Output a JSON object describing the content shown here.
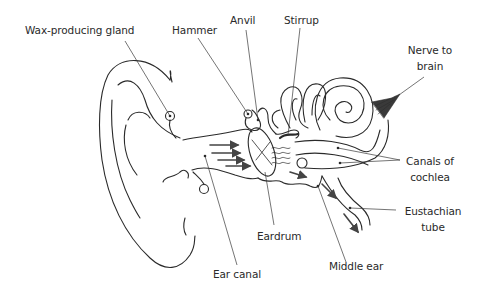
{
  "diagram": {
    "line_color": "#2a2a2a",
    "background": "#ffffff",
    "labels": {
      "wax_gland": "Wax-producing gland",
      "hammer": "Hammer",
      "anvil": "Anvil",
      "stirrup": "Stirrup",
      "nerve_line1": "Nerve to",
      "nerve_line2": "brain",
      "canals_line1": "Canals of",
      "canals_line2": "cochlea",
      "eustachian_line1": "Eustachian",
      "eustachian_line2": "tube",
      "eardrum": "Eardrum",
      "ear_canal": "Ear canal",
      "middle_ear": "Middle ear"
    }
  }
}
